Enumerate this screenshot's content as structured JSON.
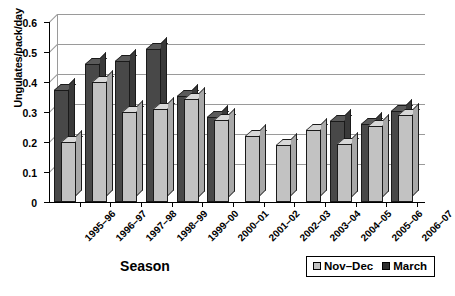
{
  "chart_data": {
    "type": "bar",
    "title": "",
    "xlabel": "Season",
    "ylabel": "Ungulates/pack/day",
    "ylim": [
      0,
      0.6
    ],
    "ytick_labels": [
      "0.6",
      "0.5",
      "0.4",
      "0.3",
      "0.2",
      "0.1",
      "0"
    ],
    "ytick_values": [
      0.6,
      0.5,
      0.4,
      0.3,
      0.2,
      0.1,
      0
    ],
    "grid": true,
    "legend_position": "bottom-right",
    "categories": [
      "1995–96",
      "1996–97",
      "1997–98",
      "1998–99",
      "1999–00",
      "2000–01",
      "2001–02",
      "2002–03",
      "2003–04",
      "2004–05",
      "2005–06",
      "2006–07"
    ],
    "series": [
      {
        "name": "Nov–Dec",
        "color": "#c2c2c2",
        "values": [
          0.2,
          0.4,
          0.3,
          0.31,
          0.345,
          0.275,
          0.22,
          0.19,
          0.24,
          0.195,
          0.255,
          0.29
        ]
      },
      {
        "name": "March",
        "color": "#484848",
        "values": [
          0.375,
          0.46,
          0.47,
          0.51,
          0.355,
          0.285,
          null,
          null,
          null,
          0.27,
          0.26,
          0.305
        ]
      }
    ]
  },
  "legend": {
    "items": [
      {
        "label": "Nov–Dec"
      },
      {
        "label": "March"
      }
    ]
  }
}
